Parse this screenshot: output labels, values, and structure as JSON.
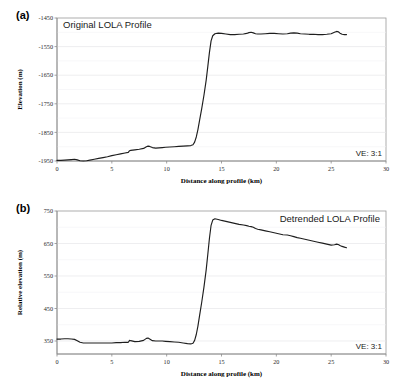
{
  "figure": {
    "panel_a_label": "(a)",
    "panel_b_label": "(b)"
  },
  "chart_data": [
    {
      "id": "panel-a",
      "type": "line",
      "title": "Original LOLA Profile",
      "xlabel": "Distance along profile (km)",
      "ylabel": "Elevation (m)",
      "annotation": "VE: 3:1",
      "xlim": [
        0,
        30
      ],
      "ylim": [
        -1950,
        -1450
      ],
      "xticks": [
        0,
        5,
        10,
        15,
        20,
        25,
        30
      ],
      "yticks": [
        -1450,
        -1550,
        -1650,
        -1750,
        -1850,
        -1950
      ],
      "xtick_labels": [
        "0",
        "5",
        "10",
        "15",
        "20",
        "25",
        "30"
      ],
      "ytick_labels": [
        "-1450",
        "-1550",
        "-1650",
        "-1750",
        "-1850",
        "-1950"
      ],
      "grid": true,
      "legend": "none",
      "series": [
        {
          "name": "Original LOLA elevation profile",
          "x": [
            0.0,
            0.35,
            0.7,
            1.0,
            1.3,
            1.6,
            1.85,
            2.1,
            2.4,
            2.7,
            3.0,
            3.4,
            3.8,
            4.2,
            4.6,
            5.0,
            5.4,
            5.8,
            6.2,
            6.5,
            6.62,
            6.72,
            7.1,
            7.5,
            7.9,
            8.15,
            8.3,
            8.45,
            8.7,
            9.0,
            9.3,
            9.6,
            9.9,
            10.3,
            10.7,
            11.1,
            11.5,
            11.9,
            12.2,
            12.4,
            12.55,
            12.7,
            12.85,
            13.0,
            13.2,
            13.4,
            13.6,
            13.75,
            13.9,
            14.05,
            14.2,
            14.4,
            14.7,
            15.0,
            15.4,
            15.8,
            16.2,
            16.6,
            17.0,
            17.3,
            17.5,
            17.7,
            17.9,
            18.1,
            18.3,
            18.6,
            19.0,
            19.4,
            19.8,
            20.2,
            20.6,
            21.0,
            21.3,
            21.6,
            21.9,
            22.2,
            22.6,
            23.0,
            23.4,
            23.8,
            24.2,
            24.6,
            25.0,
            25.3,
            25.5,
            25.65,
            25.8,
            26.0,
            26.2,
            26.4
          ],
          "y": [
            -1948,
            -1948,
            -1947,
            -1946,
            -1945,
            -1944,
            -1946,
            -1949,
            -1950,
            -1949,
            -1947,
            -1944,
            -1941,
            -1938,
            -1935,
            -1931,
            -1928,
            -1925,
            -1922,
            -1920,
            -1914,
            -1913,
            -1911,
            -1909,
            -1906,
            -1900,
            -1898,
            -1899,
            -1903,
            -1905,
            -1904,
            -1903,
            -1902,
            -1901,
            -1900,
            -1899,
            -1898,
            -1897,
            -1896,
            -1893,
            -1884,
            -1866,
            -1840,
            -1808,
            -1766,
            -1720,
            -1668,
            -1620,
            -1570,
            -1530,
            -1512,
            -1505,
            -1503,
            -1504,
            -1506,
            -1508,
            -1508,
            -1507,
            -1506,
            -1504,
            -1501,
            -1500,
            -1502,
            -1505,
            -1506,
            -1506,
            -1505,
            -1504,
            -1504,
            -1505,
            -1506,
            -1505,
            -1503,
            -1502,
            -1503,
            -1505,
            -1506,
            -1507,
            -1507,
            -1508,
            -1508,
            -1507,
            -1505,
            -1500,
            -1497,
            -1498,
            -1503,
            -1507,
            -1508,
            -1508
          ]
        }
      ]
    },
    {
      "id": "panel-b",
      "type": "line",
      "title": "Detrended LOLA Profile",
      "xlabel": "Distance along profile (km)",
      "ylabel": "Relative elevation (m)",
      "annotation": "VE: 3:1",
      "xlim": [
        0,
        30
      ],
      "ylim": [
        310,
        750
      ],
      "xticks": [
        0,
        5,
        10,
        15,
        20,
        25,
        30
      ],
      "yticks": [
        350,
        450,
        550,
        650,
        750
      ],
      "xtick_labels": [
        "0",
        "5",
        "10",
        "15",
        "20",
        "25",
        "30"
      ],
      "ytick_labels": [
        "350",
        "450",
        "550",
        "650",
        "750"
      ],
      "grid": true,
      "legend": "none",
      "series": [
        {
          "name": "Detrended LOLA elevation profile",
          "x": [
            0.0,
            0.35,
            0.7,
            1.0,
            1.3,
            1.6,
            1.85,
            2.1,
            2.4,
            2.7,
            3.0,
            3.4,
            3.8,
            4.2,
            4.6,
            5.0,
            5.4,
            5.8,
            6.2,
            6.5,
            6.62,
            6.72,
            7.1,
            7.5,
            7.9,
            8.15,
            8.3,
            8.45,
            8.7,
            9.0,
            9.3,
            9.6,
            9.9,
            10.3,
            10.7,
            11.1,
            11.5,
            11.9,
            12.2,
            12.4,
            12.55,
            12.7,
            12.85,
            13.0,
            13.2,
            13.4,
            13.6,
            13.75,
            13.9,
            14.05,
            14.2,
            14.4,
            14.7,
            15.0,
            15.4,
            15.8,
            16.2,
            16.6,
            17.0,
            17.3,
            17.5,
            17.7,
            17.9,
            18.1,
            18.3,
            18.6,
            19.0,
            19.4,
            19.8,
            20.2,
            20.6,
            21.0,
            21.3,
            21.6,
            21.9,
            22.2,
            22.6,
            23.0,
            23.4,
            23.8,
            24.2,
            24.6,
            25.0,
            25.3,
            25.5,
            25.65,
            25.8,
            26.0,
            26.2,
            26.4
          ],
          "y": [
            356,
            356,
            357,
            357,
            356,
            355,
            351,
            346,
            344,
            344,
            344,
            344,
            344,
            344,
            344,
            344,
            345,
            345,
            346,
            346,
            352,
            351,
            348,
            349,
            352,
            358,
            359,
            356,
            351,
            350,
            350,
            350,
            349,
            348,
            347,
            346,
            344,
            342,
            341,
            343,
            352,
            370,
            396,
            428,
            470,
            516,
            568,
            616,
            666,
            706,
            722,
            726,
            724,
            721,
            718,
            715,
            712,
            709,
            707,
            705,
            703,
            702,
            700,
            696,
            694,
            692,
            689,
            686,
            683,
            680,
            677,
            676,
            674,
            671,
            668,
            666,
            663,
            660,
            657,
            654,
            651,
            648,
            645,
            646,
            648,
            647,
            644,
            641,
            639,
            637
          ]
        }
      ]
    }
  ]
}
